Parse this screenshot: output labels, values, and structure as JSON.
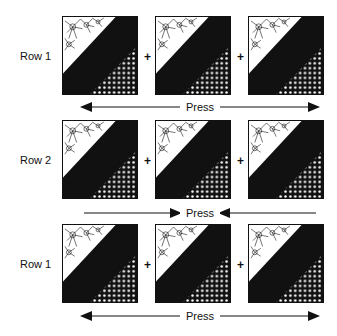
{
  "rows": [
    {
      "label": "Row 1",
      "press": {
        "label": "Press",
        "direction": "outward"
      }
    },
    {
      "label": "Row 2",
      "press": {
        "label": "Press",
        "direction": "inward"
      }
    },
    {
      "label": "Row 1",
      "press": {
        "label": "Press",
        "direction": "outward"
      }
    }
  ],
  "joiner": "+",
  "colors": {
    "ink": "#111111",
    "paper": "#ffffff"
  }
}
